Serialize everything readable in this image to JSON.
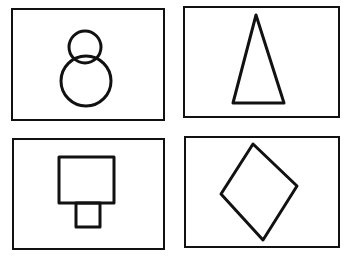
{
  "figure": {
    "description": "Four line-drawn shapes, each inside a rectangular frame, arranged in a 2x2 grid",
    "stroke_color": "#111111",
    "background_color": "#ffffff",
    "panels": [
      {
        "position": "top-left",
        "shape": "two stacked circles (small circle above larger circle, figure-eight / snowman)"
      },
      {
        "position": "top-right",
        "shape": "tall narrow isosceles triangle"
      },
      {
        "position": "bottom-left",
        "shape": "square with smaller rectangle attached below"
      },
      {
        "position": "bottom-right",
        "shape": "diamond (rhombus)"
      }
    ]
  }
}
